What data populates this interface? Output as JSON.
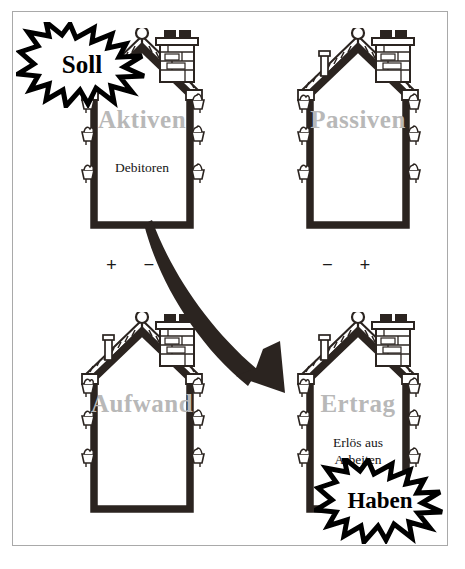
{
  "figure": {
    "title_hidden": "Soll und Haben Bilanz- und Erfolgsrechnung Haeuser",
    "frame_color": "#a9a9a9",
    "ink_color": "#2b2420",
    "label_color": "#b8b8b8",
    "text_color": "#151515"
  },
  "houses": [
    {
      "id": "aktiven",
      "label": "Aktiven",
      "entry": "Debitoren",
      "signs": "+  −",
      "sign_left": "+",
      "sign_right": "−"
    },
    {
      "id": "passiven",
      "label": "Passiven",
      "entry": "",
      "signs": "−  +",
      "sign_left": "−",
      "sign_right": "+"
    },
    {
      "id": "aufwand",
      "label": "Aufwand",
      "entry": "",
      "signs": "",
      "sign_left": "",
      "sign_right": ""
    },
    {
      "id": "ertrag",
      "label": "Ertrag",
      "entry_line1": "Erlös aus",
      "entry_line2": "Arbeiten",
      "signs": "",
      "sign_left": "",
      "sign_right": ""
    }
  ],
  "bursts": [
    {
      "id": "soll",
      "text": "Soll"
    },
    {
      "id": "haben",
      "text": "Haben"
    }
  ],
  "arrow": {
    "id": "flow-arrow",
    "from": "aktiven",
    "to": "ertrag",
    "description": "curved arrow"
  },
  "icons": {
    "finial": "roof-finial-icon",
    "chimney": "brick-chimney-icon",
    "vent": "roof-vent-pipe-icon",
    "planter": "wall-planter-icon",
    "starburst": "starburst-icon",
    "arrow": "curved-arrow-icon"
  }
}
